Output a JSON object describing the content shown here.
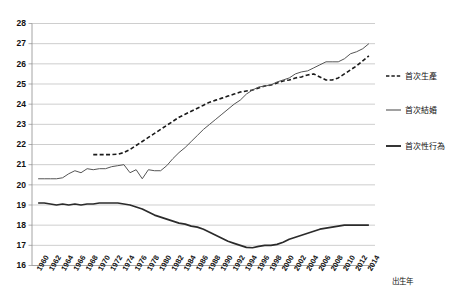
{
  "chart_data": {
    "type": "line",
    "title": "",
    "xlabel": "出生年",
    "ylabel": "",
    "xlim": [
      1959,
      2015
    ],
    "ylim": [
      16,
      28
    ],
    "grid": true,
    "legend_position": "right",
    "ytick_labels": [
      "16",
      "17",
      "18",
      "19",
      "20",
      "21",
      "22",
      "23",
      "24",
      "25",
      "26",
      "27",
      "28"
    ],
    "ytick_values": [
      16,
      17,
      18,
      19,
      20,
      21,
      22,
      23,
      24,
      25,
      26,
      27,
      28
    ],
    "xtick_labels": [
      "1960",
      "1962",
      "1964",
      "1966",
      "1968",
      "1970",
      "1972",
      "1974",
      "1976",
      "1978",
      "1980",
      "1982",
      "1984",
      "1986",
      "1988",
      "1990",
      "1992",
      "1994",
      "1996",
      "1998",
      "2000",
      "2002",
      "2004",
      "2006",
      "2008",
      "2010",
      "2012",
      "2014"
    ],
    "xtick_values": [
      1960,
      1962,
      1964,
      1966,
      1968,
      1970,
      1972,
      1974,
      1976,
      1978,
      1980,
      1982,
      1984,
      1986,
      1988,
      1990,
      1992,
      1994,
      1996,
      1998,
      2000,
      2002,
      2004,
      2006,
      2008,
      2010,
      2012,
      2014
    ],
    "series": [
      {
        "name": "首次生產",
        "style": "dashed",
        "color": "#1a1a1a",
        "width": 1.6,
        "x": [
          1969,
          1970,
          1971,
          1972,
          1973,
          1974,
          1975,
          1976,
          1977,
          1978,
          1979,
          1980,
          1981,
          1982,
          1983,
          1984,
          1985,
          1986,
          1987,
          1988,
          1989,
          1990,
          1991,
          1992,
          1993,
          1994,
          1995,
          1996,
          1997,
          1998,
          1999,
          2000,
          2001,
          2002,
          2003,
          2004,
          2005,
          2006,
          2007,
          2008,
          2009,
          2010,
          2011,
          2012,
          2013,
          2014
        ],
        "values": [
          21.5,
          21.5,
          21.5,
          21.5,
          21.52,
          21.6,
          21.75,
          21.95,
          22.15,
          22.35,
          22.55,
          22.75,
          22.95,
          23.15,
          23.35,
          23.5,
          23.65,
          23.8,
          23.95,
          24.1,
          24.2,
          24.3,
          24.4,
          24.5,
          24.6,
          24.65,
          24.7,
          24.8,
          24.9,
          24.95,
          25.05,
          25.15,
          25.2,
          25.3,
          25.35,
          25.45,
          25.5,
          25.35,
          25.2,
          25.2,
          25.3,
          25.5,
          25.7,
          25.9,
          26.15,
          26.4
        ]
      },
      {
        "name": "首次結婚",
        "style": "solid",
        "color": "#555555",
        "width": 1.0,
        "x": [
          1960,
          1961,
          1962,
          1963,
          1964,
          1965,
          1966,
          1967,
          1968,
          1969,
          1970,
          1971,
          1972,
          1973,
          1974,
          1975,
          1976,
          1977,
          1978,
          1979,
          1980,
          1981,
          1982,
          1983,
          1984,
          1985,
          1986,
          1987,
          1988,
          1989,
          1990,
          1991,
          1992,
          1993,
          1994,
          1995,
          1996,
          1997,
          1998,
          1999,
          2000,
          2001,
          2002,
          2003,
          2004,
          2005,
          2006,
          2007,
          2008,
          2009,
          2010,
          2011,
          2012,
          2013,
          2014
        ],
        "values": [
          20.3,
          20.3,
          20.3,
          20.3,
          20.35,
          20.55,
          20.7,
          20.6,
          20.8,
          20.75,
          20.8,
          20.8,
          20.9,
          20.95,
          21.0,
          20.6,
          20.75,
          20.3,
          20.75,
          20.7,
          20.7,
          20.95,
          21.3,
          21.6,
          21.85,
          22.15,
          22.45,
          22.75,
          23.0,
          23.25,
          23.5,
          23.75,
          24.0,
          24.2,
          24.5,
          24.7,
          24.85,
          24.9,
          24.95,
          25.1,
          25.2,
          25.3,
          25.5,
          25.6,
          25.65,
          25.8,
          25.95,
          26.1,
          26.1,
          26.1,
          26.25,
          26.5,
          26.6,
          26.75,
          27.0
        ]
      },
      {
        "name": "首次性行為",
        "style": "solid",
        "color": "#2b2b2b",
        "width": 1.7,
        "x": [
          1960,
          1961,
          1962,
          1963,
          1964,
          1965,
          1966,
          1967,
          1968,
          1969,
          1970,
          1971,
          1972,
          1973,
          1974,
          1975,
          1976,
          1977,
          1978,
          1979,
          1980,
          1981,
          1982,
          1983,
          1984,
          1985,
          1986,
          1987,
          1988,
          1989,
          1990,
          1991,
          1992,
          1993,
          1994,
          1995,
          1996,
          1997,
          1998,
          1999,
          2000,
          2001,
          2002,
          2003,
          2004,
          2005,
          2006,
          2007,
          2008,
          2009,
          2010,
          2011,
          2012,
          2013,
          2014
        ],
        "values": [
          19.1,
          19.1,
          19.05,
          19.0,
          19.05,
          19.0,
          19.05,
          19.0,
          19.05,
          19.05,
          19.1,
          19.1,
          19.1,
          19.1,
          19.05,
          19.0,
          18.9,
          18.8,
          18.65,
          18.5,
          18.4,
          18.3,
          18.2,
          18.1,
          18.05,
          17.95,
          17.9,
          17.8,
          17.65,
          17.5,
          17.35,
          17.2,
          17.1,
          17.0,
          16.9,
          16.88,
          16.95,
          17.0,
          17.0,
          17.05,
          17.15,
          17.3,
          17.4,
          17.5,
          17.6,
          17.7,
          17.8,
          17.85,
          17.9,
          17.95,
          18.0,
          18.0,
          18.0,
          18.0,
          18.0
        ]
      }
    ]
  },
  "legend": {
    "items": [
      {
        "label": "首次生產",
        "style": "dashed"
      },
      {
        "label": "首次結婚",
        "style": "solid"
      },
      {
        "label": "首次性行為",
        "style": "solid-thick"
      }
    ]
  },
  "axis": {
    "x_title": "出生年"
  }
}
